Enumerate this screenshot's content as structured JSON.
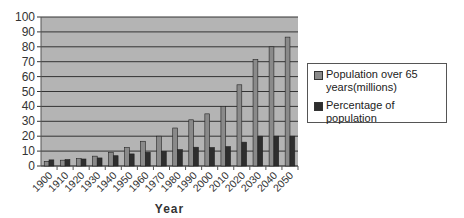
{
  "chart_data": {
    "type": "bar",
    "title": "",
    "xlabel": "Year",
    "ylabel": "",
    "ylim": [
      0,
      100
    ],
    "yticks": [
      0,
      10,
      20,
      30,
      40,
      50,
      60,
      70,
      80,
      90,
      100
    ],
    "grid": true,
    "legend_position": "right",
    "categories": [
      "1900",
      "1910",
      "1920",
      "1930",
      "1940",
      "1950",
      "1960",
      "1970",
      "1980",
      "1990",
      "2000",
      "2010",
      "2020",
      "2030",
      "2040",
      "2050"
    ],
    "series": [
      {
        "name": "Population over 65 years(millions)",
        "color": "#8a8a8a",
        "values": [
          3.1,
          3.9,
          4.9,
          6.6,
          9.0,
          12.3,
          16.6,
          20.0,
          25.5,
          31.0,
          35.0,
          40.0,
          54.5,
          71.5,
          80.0,
          86.5
        ]
      },
      {
        "name": "Percentage of population",
        "color": "#2e2e2e",
        "values": [
          4.1,
          4.3,
          4.7,
          5.4,
          6.9,
          8.1,
          9.2,
          9.8,
          11.0,
          12.6,
          12.4,
          13.0,
          16.0,
          20.0,
          20.0,
          20.0
        ]
      }
    ]
  },
  "legend": {
    "items": [
      {
        "label": "Population over 65 years(millions)",
        "color": "#8a8a8a"
      },
      {
        "label": "Percentage of population",
        "color": "#2e2e2e"
      }
    ]
  },
  "colors": {
    "plot_bg": "#b4b4b4",
    "grid": "#333333"
  }
}
